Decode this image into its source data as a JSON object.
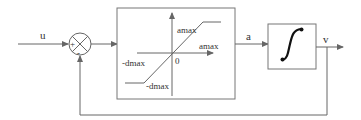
{
  "diagram": {
    "type": "block-diagram",
    "signals": {
      "input": "u",
      "saturation_output": "a",
      "output": "v"
    },
    "summing_junction": {
      "plus_sign": "+",
      "minus_sign": "-"
    },
    "saturation_block": {
      "upper_output_label": "amax",
      "upper_input_label": "amax",
      "lower_input_label": "-dmax",
      "lower_output_label": "-dmax",
      "origin_label": "0"
    },
    "integrator_block": {
      "icon": "integral-icon"
    },
    "colors": {
      "line": "#666666",
      "text": "#333333",
      "background": "#ffffff"
    }
  }
}
